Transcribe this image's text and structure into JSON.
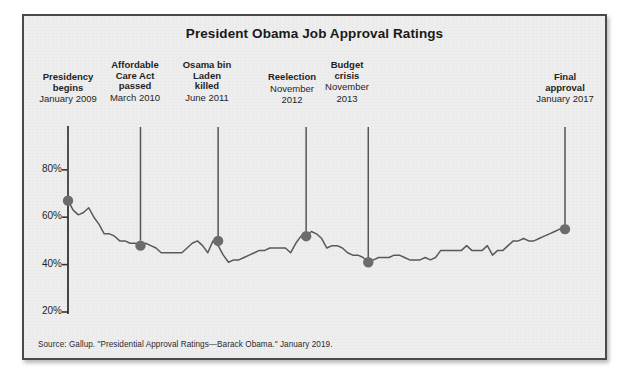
{
  "figure": {
    "title": "President Obama Job Approval Ratings",
    "source_note": "Source: Gallup. \"Presidential Approval Ratings—Barack Obama.\" January 2019.",
    "background_color": "#eeeeee",
    "border_color": "#4a4a4a",
    "line_color": "#595959",
    "marker_color": "#6b6b6b",
    "axis_color": "#333333"
  },
  "axis": {
    "y_ticks": [
      {
        "label": "80%"
      },
      {
        "label": "60%"
      },
      {
        "label": "40%"
      },
      {
        "label": "20%"
      }
    ]
  },
  "annotations": [
    {
      "label_line1": "Presidency",
      "label_line2": "begins",
      "date": "January 2009"
    },
    {
      "label_line1": "Affordable",
      "label_line2": "Care Act",
      "label_line3": "passed",
      "date": "March 2010"
    },
    {
      "label_line1": "Osama bin",
      "label_line2": "Laden",
      "label_line3": "killed",
      "date": "June 2011"
    },
    {
      "label_line1": "Reelection",
      "date_line1": "November",
      "date_line2": "2012"
    },
    {
      "label_line1": "Budget",
      "label_line2": "crisis",
      "date_line1": "November",
      "date_line2": "2013"
    },
    {
      "label_line1": "Final",
      "label_line2": "approval",
      "date": "January 2017"
    }
  ],
  "chart_data": {
    "type": "line",
    "title": "President Obama Job Approval Ratings",
    "xlabel": "",
    "ylabel": "Approval rating",
    "ylim": [
      20,
      85
    ],
    "yticks": [
      20,
      40,
      60,
      80
    ],
    "ytick_labels": [
      "20%",
      "40%",
      "60%",
      "80%"
    ],
    "grid": false,
    "legend": "none",
    "source": "Source: Gallup. \"Presidential Approval Ratings—Barack Obama.\" January 2019.",
    "x_range": [
      "2009-01",
      "2017-01"
    ],
    "series": [
      {
        "name": "Job approval rating",
        "color": "#595959",
        "x": [
          "2009-01",
          "2009-02",
          "2009-03",
          "2009-04",
          "2009-05",
          "2009-06",
          "2009-07",
          "2009-08",
          "2009-09",
          "2009-10",
          "2009-11",
          "2009-12",
          "2010-01",
          "2010-02",
          "2010-03",
          "2010-04",
          "2010-05",
          "2010-06",
          "2010-07",
          "2010-08",
          "2010-09",
          "2010-10",
          "2010-11",
          "2010-12",
          "2011-01",
          "2011-02",
          "2011-03",
          "2011-04",
          "2011-05",
          "2011-06",
          "2011-07",
          "2011-08",
          "2011-09",
          "2011-10",
          "2011-11",
          "2011-12",
          "2012-01",
          "2012-02",
          "2012-03",
          "2012-04",
          "2012-05",
          "2012-06",
          "2012-07",
          "2012-08",
          "2012-09",
          "2012-10",
          "2012-11",
          "2012-12",
          "2013-01",
          "2013-02",
          "2013-03",
          "2013-04",
          "2013-05",
          "2013-06",
          "2013-07",
          "2013-08",
          "2013-09",
          "2013-10",
          "2013-11",
          "2013-12",
          "2014-01",
          "2014-02",
          "2014-03",
          "2014-04",
          "2014-05",
          "2014-06",
          "2014-07",
          "2014-08",
          "2014-09",
          "2014-10",
          "2014-11",
          "2014-12",
          "2015-01",
          "2015-02",
          "2015-03",
          "2015-04",
          "2015-05",
          "2015-06",
          "2015-07",
          "2015-08",
          "2015-09",
          "2015-10",
          "2015-11",
          "2015-12",
          "2016-01",
          "2016-02",
          "2016-03",
          "2016-04",
          "2016-05",
          "2016-06",
          "2016-07",
          "2016-08",
          "2016-09",
          "2016-10",
          "2016-11",
          "2016-12",
          "2017-01"
        ],
        "values": [
          67,
          63,
          61,
          62,
          64,
          60,
          57,
          53,
          53,
          52,
          50,
          50,
          49,
          49,
          48,
          49,
          48,
          47,
          45,
          45,
          45,
          45,
          45,
          47,
          49,
          50,
          48,
          45,
          50,
          48,
          44,
          41,
          42,
          42,
          43,
          44,
          45,
          46,
          46,
          47,
          47,
          47,
          47,
          45,
          49,
          52,
          52,
          54,
          53,
          51,
          47,
          48,
          48,
          47,
          45,
          44,
          44,
          43,
          41,
          42,
          43,
          43,
          43,
          44,
          44,
          43,
          42,
          42,
          42,
          43,
          42,
          43,
          46,
          46,
          46,
          46,
          46,
          48,
          46,
          46,
          46,
          48,
          44,
          46,
          46,
          48,
          50,
          50,
          51,
          50,
          50,
          51,
          52,
          53,
          54,
          55,
          55
        ]
      }
    ],
    "markers": [
      {
        "label": "Presidency begins",
        "date": "January 2009",
        "value": 67
      },
      {
        "label": "Affordable Care Act passed",
        "date": "March 2010",
        "value": 48
      },
      {
        "label": "Osama bin Laden killed",
        "date": "June 2011",
        "value": 50
      },
      {
        "label": "Reelection",
        "date": "November 2012",
        "value": 52
      },
      {
        "label": "Budget crisis",
        "date": "November 2013",
        "value": 41
      },
      {
        "label": "Final approval",
        "date": "January 2017",
        "value": 55
      }
    ]
  },
  "layout": {
    "plot": {
      "x0": 66,
      "x1": 563,
      "y_top_value": 85,
      "y_bottom_value": 20,
      "y_top_px": 156,
      "y_bottom_px": 312
    },
    "marker_x": [
      66,
      133,
      205,
      290,
      345,
      563
    ],
    "annotation_x": [
      66,
      133,
      205,
      290,
      345,
      563
    ],
    "leader_top_px": 125
  }
}
